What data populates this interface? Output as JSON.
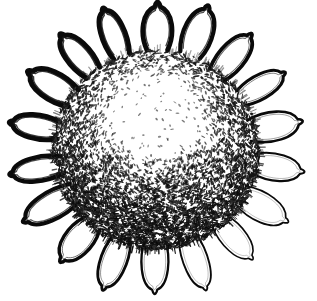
{
  "image": {
    "title": "Sunflower",
    "subject": "sunflower-flower-head",
    "style": "black-and-white pen-and-ink / woodcut line illustration",
    "medium": "ink drawing, high-contrast monochrome",
    "width": 317,
    "height": 301,
    "background_color": "#ffffff",
    "ink_color": "#000000",
    "orientation": "face-on, front view"
  },
  "palette": {
    "background": "#ffffff",
    "ink": "#0a0a0a",
    "ink_soft": "#1c1c1c",
    "ink_mid": "#2e2e2e",
    "petal_fill": "#ffffff",
    "disc_light": "#ffffff",
    "disc_dark": "#141414"
  },
  "composition": {
    "center_x": 156,
    "center_y": 147,
    "bounds": {
      "left": 12,
      "top": 10,
      "right": 302,
      "bottom": 288
    },
    "layers": [
      "petal-ring",
      "seed-disc",
      "disc-shading"
    ]
  },
  "petals": {
    "label": "ray florets / petals",
    "count": 18,
    "shape": "rounded teardrop lobe",
    "fill": "#ffffff",
    "outline_color": "#0a0a0a",
    "outline_weight_min": 1.6,
    "outline_weight_max": 5.2,
    "inner_contour": true,
    "ring_inner_radius": 96,
    "ring_outer_radius": 146,
    "lobe_width": 30,
    "lobe_height": 52,
    "start_angle_deg": -90,
    "heavy_shadow_side": "upper-left"
  },
  "seed_disc": {
    "label": "seed head / disc florets",
    "radius_x": 104,
    "radius_y": 100,
    "center_x": 156,
    "center_y": 150,
    "edge": "ragged radial bristle fringe",
    "seed_mark": {
      "shape": "short elongated dash / grain",
      "length_min": 2.2,
      "length_max": 5.4,
      "width_min": 1.0,
      "width_max": 2.0
    },
    "total_marks": 4200,
    "tone_zones": [
      {
        "name": "highlight-center",
        "cy_offset": -42,
        "density": 0.07,
        "tone": "very sparse white"
      },
      {
        "name": "upper-mid",
        "cy_offset": -14,
        "density": 0.42,
        "tone": "medium"
      },
      {
        "name": "outer-ring",
        "cy_offset": 0,
        "density": 0.78,
        "tone": "dense"
      },
      {
        "name": "lower-shadow",
        "cy_offset": 46,
        "density": 1.0,
        "tone": "darkest / near-solid"
      }
    ],
    "light_direction": "from upper-center",
    "shading_gradient": "light at top-center fading to very dark at bottom"
  },
  "render": {
    "seed_count": 4600,
    "bristle_count": 300,
    "random_seed": 20240517
  }
}
